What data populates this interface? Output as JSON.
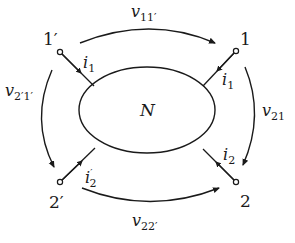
{
  "diagram": {
    "type": "two-port network",
    "network_label": "N",
    "terminals": {
      "t1p": "1′",
      "t1": "1",
      "t2p": "2′",
      "t2": "2"
    },
    "currents": {
      "i1_left": {
        "base": "i",
        "sub": "1"
      },
      "i1_right": {
        "base": "i",
        "sub": "1"
      },
      "i2_left": {
        "base": "i",
        "sub": "2",
        "prime": "′"
      },
      "i2_right": {
        "base": "i",
        "sub": "2"
      }
    },
    "voltages": {
      "top": {
        "base": "v",
        "sub": "11′"
      },
      "left": {
        "base": "v",
        "sub": "2′1′"
      },
      "right": {
        "base": "v",
        "sub": "21"
      },
      "bottom": {
        "base": "v",
        "sub": "22′"
      }
    },
    "colors": {
      "stroke": "#1a1a1a",
      "background": "#ffffff"
    }
  }
}
